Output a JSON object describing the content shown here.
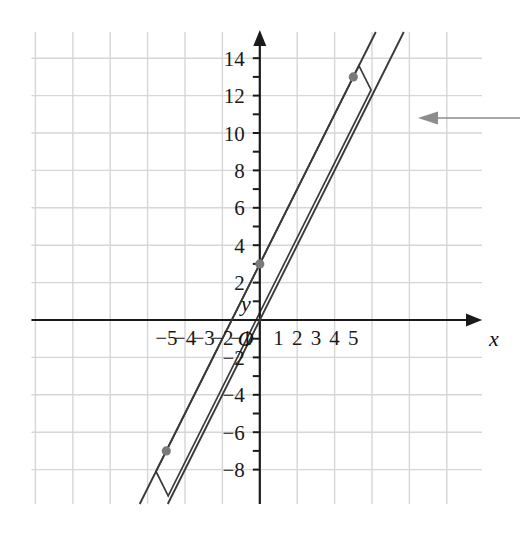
{
  "figure": {
    "title": "",
    "origin_label": "O",
    "x_axis_label": "x",
    "y_axis_label": "y"
  },
  "chart_data": {
    "type": "line",
    "title": "",
    "xlabel": "x",
    "ylabel": "y",
    "grid": true,
    "legend": "none",
    "xlim": [
      -6,
      6
    ],
    "ylim": [
      -9,
      15
    ],
    "x_ticks": [
      -5,
      -4,
      -3,
      -2,
      -1,
      1,
      2,
      3,
      4,
      5
    ],
    "x_tick_labels": [
      "−5",
      "−4",
      "−3",
      "−2",
      "−1",
      "1",
      "2",
      "3",
      "4",
      "5"
    ],
    "y_ticks": [
      -8,
      -6,
      -4,
      -2,
      2,
      4,
      6,
      8,
      10,
      12,
      14
    ],
    "y_tick_labels": [
      "−8",
      "−6",
      "−4",
      "−2",
      "2",
      "4",
      "6",
      "8",
      "10",
      "12",
      "14"
    ],
    "grid_step_x": 2,
    "grid_step_y": 2,
    "series": [
      {
        "name": "upper-line",
        "equation": "y = 2x + 3",
        "slope": 2,
        "intercept": 3,
        "points": [
          [
            -5,
            -7
          ],
          [
            0,
            3
          ],
          [
            5,
            13
          ]
        ]
      },
      {
        "name": "lower-line",
        "equation": "y = 2x",
        "slope": 2,
        "intercept": 0,
        "points": [
          [
            -5,
            -10
          ],
          [
            0,
            0
          ],
          [
            5,
            10
          ]
        ]
      }
    ],
    "markers": [
      {
        "name": "point-0-3",
        "x": 0,
        "y": 3,
        "color": "#7a7a7a"
      },
      {
        "name": "point-5-13",
        "x": 5,
        "y": 13,
        "color": "#7a7a7a"
      },
      {
        "name": "point-neg5-neg7",
        "x": -5,
        "y": -7,
        "color": "#7a7a7a"
      }
    ],
    "band": {
      "name": "shaded-band-outline",
      "description": "closed quadrilateral band spanning between the two parallel lines with square end caps",
      "color": "#3a3a3a"
    },
    "annotations": [
      {
        "name": "leader-arrow",
        "type": "arrow",
        "text": "",
        "direction": "left",
        "at_y": 10.8,
        "color": "#8c8c8c"
      }
    ]
  },
  "colors": {
    "grid": "#d6d6d6",
    "axis": "#1a1a1a",
    "line": "#3a3a3a",
    "marker": "#7a7a7a",
    "annotation": "#8c8c8c",
    "background": "#ffffff"
  }
}
